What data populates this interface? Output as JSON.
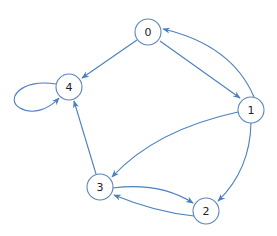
{
  "graph": {
    "directed": true,
    "colors": {
      "node_stroke": "#5b86b6",
      "edge": "#4a7fc0",
      "node_fill": "#ffffff",
      "label": "#222222"
    },
    "nodes": [
      {
        "id": "0",
        "label": "0",
        "x": 148,
        "y": 32
      },
      {
        "id": "1",
        "label": "1",
        "x": 251,
        "y": 110
      },
      {
        "id": "2",
        "label": "2",
        "x": 206,
        "y": 211
      },
      {
        "id": "3",
        "label": "3",
        "x": 100,
        "y": 187
      },
      {
        "id": "4",
        "label": "4",
        "x": 69,
        "y": 87
      }
    ],
    "edges": [
      {
        "from": "0",
        "to": "4"
      },
      {
        "from": "0",
        "to": "1"
      },
      {
        "from": "1",
        "to": "0"
      },
      {
        "from": "1",
        "to": "3"
      },
      {
        "from": "1",
        "to": "2"
      },
      {
        "from": "3",
        "to": "4"
      },
      {
        "from": "3",
        "to": "2"
      },
      {
        "from": "2",
        "to": "3"
      },
      {
        "from": "4",
        "to": "4"
      }
    ]
  }
}
